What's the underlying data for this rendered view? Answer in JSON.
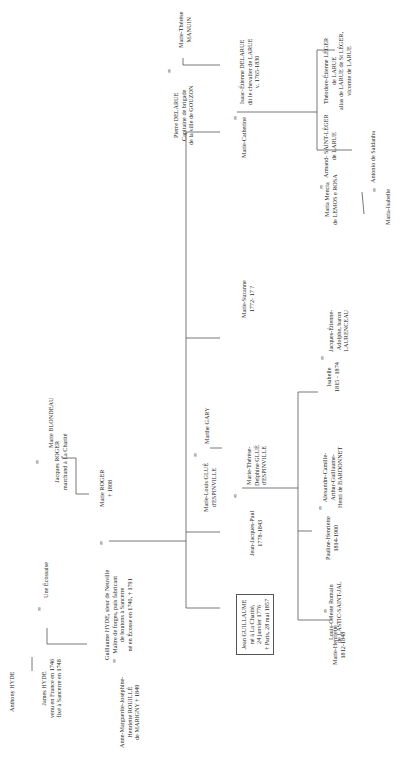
{
  "diagram": {
    "type": "genealogical-tree",
    "orientation": "rotated-90-ccw",
    "marriage_symbol": "∞",
    "people": {
      "anthony_hyde": {
        "lines": [
          "Anthony HYDE"
        ]
      },
      "james_hyde": {
        "lines": [
          "James HYDE",
          "venu en France en 1746",
          "fixé à Sancerre en 1748"
        ]
      },
      "une_ecossaise": {
        "lines": [
          "Une Écossaise"
        ]
      },
      "guillaume_hyde": {
        "lines": [
          "Guillaume HYDE, sieur de Neuville",
          "Maître de forges, puis fabricant",
          "de boutons à Sancerre",
          "né en Écosse en 1740, † 1791"
        ]
      },
      "jacques_roger": {
        "lines": [
          "Jacques ROGER",
          "marchand à La Charité"
        ]
      },
      "marie_blondeau": {
        "lines": [
          "Marie BLONDEAU"
        ]
      },
      "marie_roger": {
        "lines": [
          "Marie ROGER",
          "† 1808"
        ]
      },
      "anne_marguerite": {
        "lines": [
          "Anne-Marguerite-Joséphine-",
          "Henriette ROUILLÉ",
          "de MARIGNY † 1849"
        ]
      },
      "jean_guillaume": {
        "lines": [
          "Jean GUILLAUME",
          "né à La Charité,",
          "24 janvier 1776",
          "† Paris, 28 mai 1857"
        ]
      },
      "jean_jacques_paul": {
        "lines": [
          "Jean-Jacques-Paul",
          "1778-1843"
        ]
      },
      "marie_therese_delphine": {
        "lines": [
          "Marie-Thérèse-",
          "Delphine GLUÉ",
          "d'ESPINVILLE"
        ]
      },
      "marie_louis": {
        "lines": [
          "Marie-Louis GLUÉ",
          "d'ESPINVILLE"
        ]
      },
      "marthe_gary": {
        "lines": [
          "Marthe GARY"
        ]
      },
      "marie_suzanne": {
        "lines": [
          "Marie-Suzanne",
          "1772- 17 ?"
        ]
      },
      "marie_catherine": {
        "lines": [
          "Marie-Catherine"
        ]
      },
      "pierre_delarue": {
        "lines": [
          "Pierre DELARUE",
          "Capitaine de brigade",
          "de la ville de GOUZON"
        ]
      },
      "marie_therese_manuin": {
        "lines": [
          "Marie-Thérèse",
          "MANUIN"
        ]
      },
      "isaac_etienne": {
        "lines": [
          "Isaac-Étienne DELARUE",
          "dit le chevalier de LARUE",
          "v. 1765-1830"
        ]
      },
      "maria_mencia": {
        "lines": [
          "Maria Mencia",
          "de LEMOS e ROSA"
        ]
      },
      "armand": {
        "lines": [
          "Armand- SAINT-LÉGER",
          "de LARUE"
        ]
      },
      "theodore": {
        "lines": [
          "Théodore-Étienne LÉGER",
          "de LARUE",
          "alias de LARUE de St LÉGER,",
          "vicomte de LARUE"
        ]
      },
      "maria_isabelle": {
        "lines": [
          "Maria-Isabelle"
        ]
      },
      "antonio": {
        "lines": [
          "Antonio de Saldanha"
        ]
      },
      "marie_henriette": {
        "lines": [
          "Marie-Henriette",
          "1812-1848"
        ]
      },
      "louis_celeste": {
        "lines": [
          "Louis-Céleste Romain",
          "de LASTIC-SAINT-JAL"
        ]
      },
      "pauline_henriette": {
        "lines": [
          "Pauline-Henriette",
          "1814-1900"
        ]
      },
      "alexandre": {
        "lines": [
          "Alexandre-Camille-",
          "Arthur-Guillaume-",
          "Henri de BARDONNET"
        ]
      },
      "isabelle": {
        "lines": [
          "Isabelle",
          "1815 - 1874"
        ]
      },
      "jacques_etienne": {
        "lines": [
          "Jacques-Étienne-",
          "Adolphe, baron",
          "LAURENCEAU"
        ]
      }
    }
  }
}
